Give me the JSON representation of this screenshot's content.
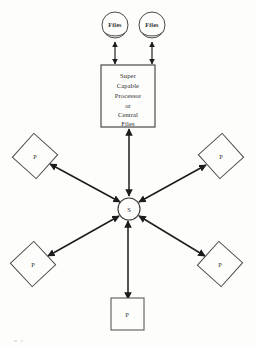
{
  "diagram": {
    "background_color": "#fdfdfc",
    "line_color": "#1c1c1c",
    "shape_stroke_color": "#4a4a4a",
    "storage_nodes": [
      {
        "id": "files-left",
        "label": "Files",
        "icon": "disk-cylinder-icon",
        "cx": 115,
        "cy": 26
      },
      {
        "id": "files-right",
        "label": "Files",
        "icon": "disk-cylinder-icon",
        "cx": 152,
        "cy": 26
      }
    ],
    "processor_box": {
      "id": "processor",
      "lines": [
        "Super",
        "Capable",
        "Processor",
        "or",
        "Central",
        "Files"
      ],
      "x": 101,
      "y": 65,
      "width": 54,
      "height": 62
    },
    "hub": {
      "id": "switch",
      "label": "S",
      "cx": 129,
      "cy": 209,
      "r": 11
    },
    "peripheral_nodes": [
      {
        "id": "p-northwest",
        "label": "P",
        "shape": "diamond",
        "cx": 35,
        "cy": 156
      },
      {
        "id": "p-northeast",
        "label": "P",
        "shape": "diamond",
        "cx": 221,
        "cy": 156
      },
      {
        "id": "p-southwest",
        "label": "P",
        "shape": "diamond",
        "cx": 33,
        "cy": 264
      },
      {
        "id": "p-southeast",
        "label": "P",
        "shape": "diamond",
        "cx": 220,
        "cy": 264
      },
      {
        "id": "p-south",
        "label": "P",
        "shape": "square",
        "cx": 127,
        "cy": 314
      }
    ],
    "connections": [
      {
        "from": "files-left",
        "to": "processor",
        "arrows": "both"
      },
      {
        "from": "files-right",
        "to": "processor",
        "arrows": "both"
      },
      {
        "from": "processor",
        "to": "switch",
        "arrows": "both"
      },
      {
        "from": "switch",
        "to": "p-northwest",
        "arrows": "both"
      },
      {
        "from": "switch",
        "to": "p-northeast",
        "arrows": "both"
      },
      {
        "from": "switch",
        "to": "p-southwest",
        "arrows": "both"
      },
      {
        "from": "switch",
        "to": "p-southeast",
        "arrows": "both"
      },
      {
        "from": "switch",
        "to": "p-south",
        "arrows": "both"
      }
    ]
  }
}
